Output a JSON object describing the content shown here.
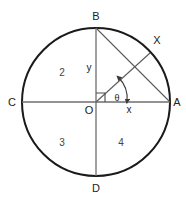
{
  "figure": {
    "type": "geometry-diagram"
  },
  "colors": {
    "circle_stroke": "#1a1a1a",
    "axis_stroke": "#6e6e6e",
    "chord_stroke": "#5a5a5a",
    "radius_stroke": "#5a5a5a",
    "arc_stroke": "#3a3a3a",
    "label_text": "#222222",
    "quadrant_text": "#444444",
    "background": "#ffffff"
  },
  "geometry": {
    "center": {
      "x": 96,
      "y": 102,
      "label": "O"
    },
    "radius": 74,
    "points": [
      {
        "name": "B",
        "x": 96,
        "y": 28,
        "label": "B",
        "position": "top"
      },
      {
        "name": "D",
        "x": 96,
        "y": 176,
        "label": "D",
        "position": "bottom"
      },
      {
        "name": "C",
        "x": 22,
        "y": 102,
        "label": "C",
        "position": "left"
      },
      {
        "name": "A",
        "x": 170,
        "y": 102,
        "label": "A",
        "position": "right"
      },
      {
        "name": "X",
        "x": 150,
        "y": 53,
        "label": "X",
        "position": "upper-right-arc"
      }
    ],
    "segments": [
      {
        "name": "vertical-diameter",
        "from": "B",
        "to": "D"
      },
      {
        "name": "horizontal-diameter",
        "from": "C",
        "to": "A"
      },
      {
        "name": "chord-BA",
        "from": "B",
        "to": "A"
      },
      {
        "name": "radius-OX",
        "from": "O",
        "to": "X"
      }
    ],
    "right_angle_marker": {
      "at": "O",
      "between": [
        "OB",
        "OA"
      ]
    },
    "angle_arc": {
      "label": "θ",
      "from_ray": "OA",
      "to_ray": "OX",
      "double_headed": true
    }
  },
  "labels": {
    "point_B": "B",
    "point_D": "D",
    "point_C": "C",
    "point_A": "A",
    "point_O": "O",
    "point_X": "X",
    "var_y": "y",
    "var_x": "x",
    "angle_theta": "θ"
  },
  "quadrants": [
    {
      "id": "2",
      "label": "2",
      "x": 58,
      "y": 72,
      "region": "upper-left"
    },
    {
      "id": "3",
      "label": "3",
      "x": 58,
      "y": 142,
      "region": "lower-left"
    },
    {
      "id": "4",
      "label": "4",
      "x": 121,
      "y": 142,
      "region": "lower-right"
    }
  ]
}
